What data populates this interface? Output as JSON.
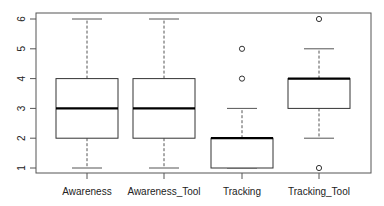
{
  "chart_data": {
    "type": "boxplot",
    "title": "",
    "xlabel": "",
    "ylabel": "",
    "ylim": [
      1,
      6
    ],
    "yticks": [
      1,
      2,
      3,
      4,
      5,
      6
    ],
    "grid": false,
    "legend": null,
    "categories": [
      "Awareness",
      "Awareness_Tool",
      "Tracking",
      "Tracking_Tool"
    ],
    "series": [
      {
        "name": "Awareness",
        "whisker_low": 1,
        "q1": 2,
        "median": 3,
        "q3": 4,
        "whisker_high": 6,
        "outliers": []
      },
      {
        "name": "Awareness_Tool",
        "whisker_low": 1,
        "q1": 2,
        "median": 3,
        "q3": 4,
        "whisker_high": 6,
        "outliers": []
      },
      {
        "name": "Tracking",
        "whisker_low": 1,
        "q1": 1,
        "median": 2,
        "q3": 2,
        "whisker_high": 3,
        "outliers": [
          4,
          5
        ]
      },
      {
        "name": "Tracking_Tool",
        "whisker_low": 2,
        "q1": 3,
        "median": 4,
        "q3": 4,
        "whisker_high": 5,
        "outliers": [
          1,
          6
        ]
      }
    ]
  },
  "colors": {
    "frame": "#555555",
    "box": "#333333",
    "median": "#000000",
    "whisker": "#555555"
  }
}
